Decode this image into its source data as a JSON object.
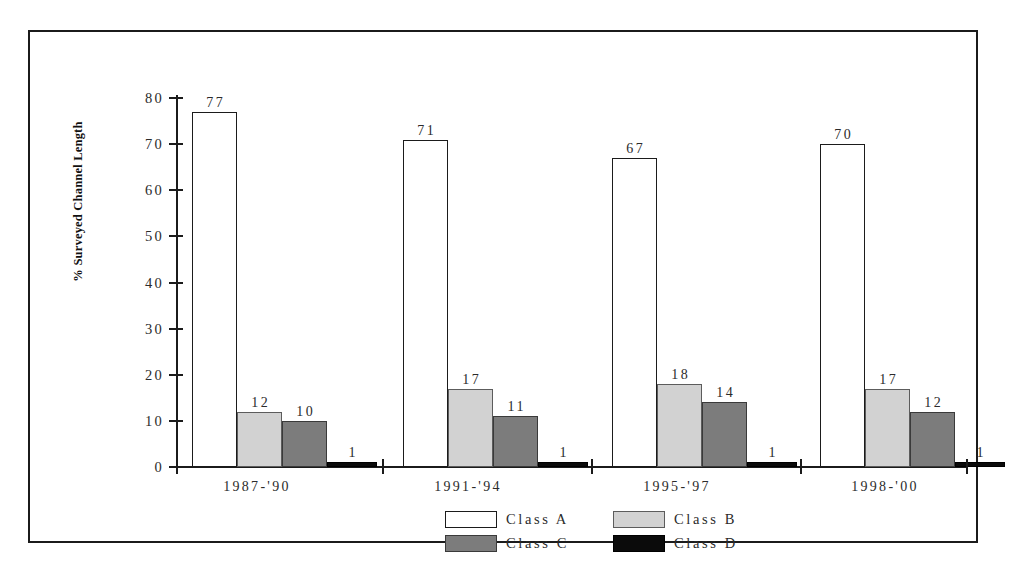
{
  "chart_data": {
    "type": "bar",
    "title": "",
    "subtitle": "",
    "xlabel": "",
    "ylabel": "% Surveyed Channel Length",
    "ylim": [
      0,
      80
    ],
    "yticks": [
      0,
      10,
      20,
      30,
      40,
      50,
      60,
      70,
      80
    ],
    "ytick_labels": [
      "0",
      "10",
      "20",
      "30",
      "40",
      "50",
      "60",
      "70",
      "80"
    ],
    "grid": false,
    "legend_position": "bottom",
    "categories": [
      "1987-'90",
      "1991-'94",
      "1995-'97",
      "1998-'00"
    ],
    "series": [
      {
        "name": "Class A",
        "color": "#ffffff",
        "edge_color": "#1b1b1b",
        "values": [
          77,
          71,
          67,
          70
        ]
      },
      {
        "name": "Class B",
        "color": "#d2d2d2",
        "edge_color": "#5c5c5c",
        "values": [
          12,
          17,
          18,
          17
        ]
      },
      {
        "name": "Class C",
        "color": "#7c7c7c",
        "edge_color": "#3a3a3a",
        "values": [
          10,
          11,
          14,
          12
        ]
      },
      {
        "name": "Class D",
        "color": "#0b0b0b",
        "edge_color": "#000000",
        "values": [
          1,
          1,
          1,
          1
        ]
      }
    ],
    "data_labels": {
      "1987-'90": {
        "Class A": "77",
        "Class B": "12",
        "Class C": "10",
        "Class D": "1"
      },
      "1991-'94": {
        "Class A": "71",
        "Class B": "17",
        "Class C": "11",
        "Class D": "1"
      },
      "1995-'97": {
        "Class A": "67",
        "Class B": "18",
        "Class C": "14",
        "Class D": "1"
      },
      "1998-'00": {
        "Class A": "70",
        "Class B": "17",
        "Class C": "12",
        "Class D": "1"
      }
    }
  },
  "legend": {
    "items": [
      {
        "label": "Class A"
      },
      {
        "label": "Class B"
      },
      {
        "label": "Class C"
      },
      {
        "label": "Class D"
      }
    ]
  },
  "axis": {
    "y_title": "% Surveyed Channel Length",
    "y_tick_labels": [
      "80",
      "70",
      "60",
      "50",
      "40",
      "30",
      "20",
      "10",
      "0"
    ]
  },
  "groups": [
    {
      "label": "1987-'90",
      "bars": [
        {
          "series": "Class A",
          "value": 77,
          "label": "77"
        },
        {
          "series": "Class B",
          "value": 12,
          "label": "12"
        },
        {
          "series": "Class C",
          "value": 10,
          "label": "10"
        },
        {
          "series": "Class D",
          "value": 1,
          "label": "1"
        }
      ]
    },
    {
      "label": "1991-'94",
      "bars": [
        {
          "series": "Class A",
          "value": 71,
          "label": "71"
        },
        {
          "series": "Class B",
          "value": 17,
          "label": "17"
        },
        {
          "series": "Class C",
          "value": 11,
          "label": "11"
        },
        {
          "series": "Class D",
          "value": 1,
          "label": "1"
        }
      ]
    },
    {
      "label": "1995-'97",
      "bars": [
        {
          "series": "Class A",
          "value": 67,
          "label": "67"
        },
        {
          "series": "Class B",
          "value": 18,
          "label": "18"
        },
        {
          "series": "Class C",
          "value": 14,
          "label": "14"
        },
        {
          "series": "Class D",
          "value": 1,
          "label": "1"
        }
      ]
    },
    {
      "label": "1998-'00",
      "bars": [
        {
          "series": "Class A",
          "value": 70,
          "label": "70"
        },
        {
          "series": "Class B",
          "value": 17,
          "label": "17"
        },
        {
          "series": "Class C",
          "value": 12,
          "label": "12"
        },
        {
          "series": "Class D",
          "value": 1,
          "label": "1"
        }
      ]
    }
  ]
}
